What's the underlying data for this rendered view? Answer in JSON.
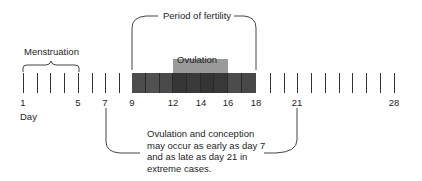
{
  "diagram": {
    "labels": {
      "period_of_fertility": "Period of fertility",
      "menstruation": "Menstruation",
      "ovulation": "Ovulation",
      "day": "Day"
    },
    "day_ticks": {
      "first": 1,
      "last": 28,
      "labeled": [
        "1",
        "5",
        "7",
        "9",
        "12",
        "14",
        "16",
        "18",
        "21",
        "28"
      ]
    },
    "ranges": {
      "menstruation": [
        1,
        5
      ],
      "period_of_fertility": [
        9,
        18
      ],
      "ovulation": [
        12,
        16
      ],
      "extreme_ovulation": [
        7,
        21
      ]
    },
    "note_lines": [
      "Ovulation and conception",
      "may occur as early as day 7",
      "and as late as day 21 in",
      "extreme cases."
    ],
    "colors": {
      "fertility_bar": "#4a4a4a",
      "fertility_bar_dark": "#333333",
      "ovulation_box": "#9a9a9a",
      "lines": "#333333"
    }
  }
}
